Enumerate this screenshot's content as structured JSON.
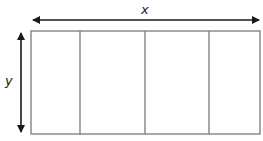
{
  "diagram": {
    "labels": {
      "x": "x",
      "y": "y"
    },
    "rectangle": {
      "sections": 4,
      "stroke_color": "#7a7a7a"
    },
    "arrow_color": "#1a1a1a"
  }
}
